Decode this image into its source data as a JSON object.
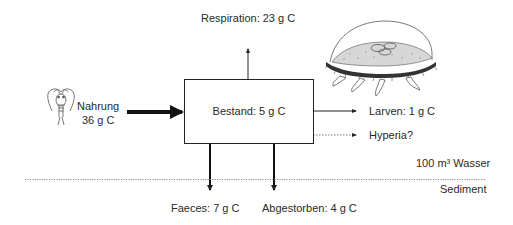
{
  "diagram": {
    "type": "carbon-flux",
    "stock": {
      "label": "Bestand: 5 g C"
    },
    "inputs": [
      {
        "label_line1": "Nahrung",
        "label_line2": "36 g C",
        "arrow_style": "thick"
      }
    ],
    "outputs": {
      "respiration": {
        "label": "Respiration: 23 g C",
        "direction": "up"
      },
      "larvae": {
        "label": "Larven: 1 g C",
        "direction": "right"
      },
      "hyperia": {
        "label": "Hyperia?",
        "direction": "right",
        "style": "dotted"
      },
      "faeces": {
        "label": "Faeces: 7 g C",
        "direction": "down"
      },
      "dead": {
        "label": "Abgestorben: 4 g C",
        "direction": "down"
      }
    },
    "zones": {
      "water": "100 m³ Wasser",
      "sediment": "Sediment"
    },
    "illustrations": [
      {
        "name": "copepod",
        "position": "left"
      },
      {
        "name": "jellyfish",
        "position": "top-right"
      }
    ]
  },
  "colors": {
    "line": "#222222",
    "text": "#2a2a2a",
    "dotted": "#777777"
  }
}
